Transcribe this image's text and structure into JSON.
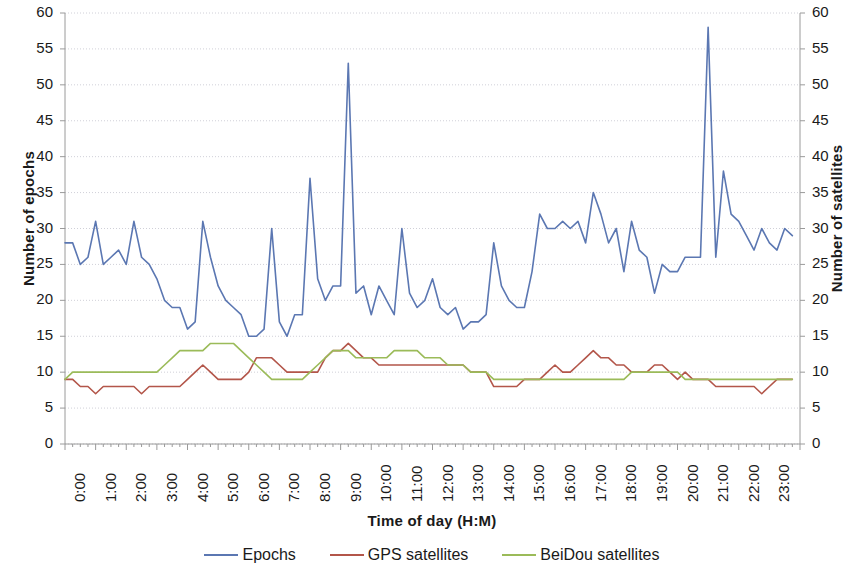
{
  "chart_data": {
    "type": "line",
    "title": "",
    "xlabel": "Time of day (H:M)",
    "ylabel": "Number of epochs",
    "y2label": "Number of satellites",
    "xlim": [
      0,
      24
    ],
    "ylim": [
      0,
      60
    ],
    "y2lim": [
      0,
      60
    ],
    "ytick_step": 5,
    "grid": true,
    "grid_style": "dotted horizontal",
    "legend_position": "bottom-center",
    "x_tick_labels": [
      "0:00",
      "1:00",
      "2:00",
      "3:00",
      "4:00",
      "5:00",
      "6:00",
      "7:00",
      "8:00",
      "9:00",
      "10:00",
      "11:00",
      "12:00",
      "13:00",
      "14:00",
      "15:00",
      "16:00",
      "17:00",
      "18:00",
      "19:00",
      "20:00",
      "21:00",
      "22:00",
      "23:00"
    ],
    "y_tick_labels": [
      "0",
      "5",
      "10",
      "15",
      "20",
      "25",
      "30",
      "35",
      "40",
      "45",
      "50",
      "55",
      "60"
    ],
    "y2_tick_labels": [
      "0",
      "5",
      "10",
      "15",
      "20",
      "25",
      "30",
      "35",
      "40",
      "45",
      "50",
      "55",
      "60"
    ],
    "minor_ticks_per_hour": 4,
    "x_values": [
      0,
      0.25,
      0.5,
      0.75,
      1,
      1.25,
      1.5,
      1.75,
      2,
      2.25,
      2.5,
      2.75,
      3,
      3.25,
      3.5,
      3.75,
      4,
      4.25,
      4.5,
      4.75,
      5,
      5.25,
      5.5,
      5.75,
      6,
      6.25,
      6.5,
      6.75,
      7,
      7.25,
      7.5,
      7.75,
      8,
      8.25,
      8.5,
      8.75,
      9,
      9.25,
      9.5,
      9.75,
      10,
      10.25,
      10.5,
      10.75,
      11,
      11.25,
      11.5,
      11.75,
      12,
      12.25,
      12.5,
      12.75,
      13,
      13.25,
      13.5,
      13.75,
      14,
      14.25,
      14.5,
      14.75,
      15,
      15.25,
      15.5,
      15.75,
      16,
      16.25,
      16.5,
      16.75,
      17,
      17.25,
      17.5,
      17.75,
      18,
      18.25,
      18.5,
      18.75,
      19,
      19.25,
      19.5,
      19.75,
      20,
      20.25,
      20.5,
      20.75,
      21,
      21.25,
      21.5,
      21.75,
      22,
      22.25,
      22.5,
      22.75,
      23,
      23.25,
      23.5,
      23.75
    ],
    "series": [
      {
        "name": "Epochs",
        "color": "#5B77B2",
        "axis": "left",
        "values": [
          28,
          28,
          25,
          26,
          31,
          25,
          26,
          27,
          25,
          31,
          26,
          25,
          23,
          20,
          19,
          19,
          16,
          17,
          31,
          26,
          22,
          20,
          19,
          18,
          15,
          15,
          16,
          30,
          17,
          15,
          18,
          18,
          37,
          23,
          20,
          22,
          22,
          53,
          21,
          22,
          18,
          22,
          20,
          18,
          30,
          21,
          19,
          20,
          23,
          19,
          18,
          19,
          16,
          17,
          17,
          18,
          28,
          22,
          20,
          19,
          19,
          24,
          32,
          30,
          30,
          31,
          30,
          31,
          28,
          35,
          32,
          28,
          30,
          24,
          31,
          27,
          26,
          21,
          25,
          24,
          24,
          26,
          26,
          26,
          58,
          26,
          38,
          32,
          31,
          29,
          27,
          30,
          28,
          27,
          30,
          29
        ]
      },
      {
        "name": "GPS satellites",
        "color": "#B3564A",
        "axis": "right",
        "values": [
          9,
          9,
          8,
          8,
          7,
          8,
          8,
          8,
          8,
          8,
          7,
          8,
          8,
          8,
          8,
          8,
          9,
          10,
          11,
          10,
          9,
          9,
          9,
          9,
          10,
          12,
          12,
          12,
          11,
          10,
          10,
          10,
          10,
          10,
          12,
          13,
          13,
          14,
          13,
          12,
          12,
          11,
          11,
          11,
          11,
          11,
          11,
          11,
          11,
          11,
          11,
          11,
          11,
          10,
          10,
          10,
          8,
          8,
          8,
          8,
          9,
          9,
          9,
          10,
          11,
          10,
          10,
          11,
          12,
          13,
          12,
          12,
          11,
          11,
          10,
          10,
          10,
          11,
          11,
          10,
          9,
          10,
          9,
          9,
          9,
          8,
          8,
          8,
          8,
          8,
          8,
          7,
          8,
          9,
          9,
          9
        ]
      },
      {
        "name": "BeiDou satellites",
        "color": "#9BBB59",
        "axis": "right",
        "values": [
          9,
          10,
          10,
          10,
          10,
          10,
          10,
          10,
          10,
          10,
          10,
          10,
          10,
          11,
          12,
          13,
          13,
          13,
          13,
          14,
          14,
          14,
          14,
          13,
          12,
          11,
          10,
          9,
          9,
          9,
          9,
          9,
          10,
          11,
          12,
          13,
          13,
          13,
          12,
          12,
          12,
          12,
          12,
          13,
          13,
          13,
          13,
          12,
          12,
          12,
          11,
          11,
          11,
          10,
          10,
          10,
          9,
          9,
          9,
          9,
          9,
          9,
          9,
          9,
          9,
          9,
          9,
          9,
          9,
          9,
          9,
          9,
          9,
          9,
          10,
          10,
          10,
          10,
          10,
          10,
          10,
          9,
          9,
          9,
          9,
          9,
          9,
          9,
          9,
          9,
          9,
          9,
          9,
          9,
          9,
          9
        ]
      }
    ]
  },
  "axes": {
    "left_title": "Number of epochs",
    "right_title": "Number of satellites",
    "x_title": "Time of day (H:M)"
  },
  "legend": {
    "items": [
      {
        "label": "Epochs",
        "color": "#5B77B2"
      },
      {
        "label": "GPS satellites",
        "color": "#B3564A"
      },
      {
        "label": "BeiDou satellites",
        "color": "#9BBB59"
      }
    ]
  },
  "style": {
    "axis_color": "#9a9a9a",
    "grid_color": "#d0d0d8",
    "text_color": "#1a1a1a",
    "background": "#ffffff"
  }
}
